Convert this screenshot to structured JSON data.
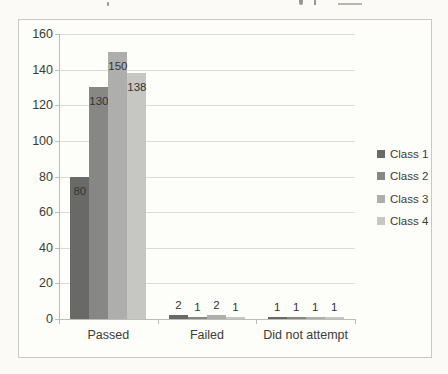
{
  "chart_data": {
    "type": "bar",
    "title": "",
    "categories": [
      "Passed",
      "Failed",
      "Did not attempt"
    ],
    "series": [
      {
        "name": "Class 1",
        "color": "#696967",
        "values": [
          80,
          2,
          1
        ]
      },
      {
        "name": "Class 2",
        "color": "#878785",
        "values": [
          130,
          1,
          1
        ]
      },
      {
        "name": "Class 3",
        "color": "#aeaeac",
        "values": [
          150,
          2,
          1
        ]
      },
      {
        "name": "Class 4",
        "color": "#c6c6c3",
        "values": [
          138,
          1,
          1
        ]
      }
    ],
    "yticks": [
      0,
      20,
      40,
      60,
      80,
      100,
      120,
      140,
      160
    ],
    "ylim": [
      0,
      160
    ],
    "ytick_step": 20,
    "grid": true,
    "legend_position": "right",
    "data_labels": true
  },
  "colors": {
    "paper": "#fbfaf6",
    "chart_background": "#fdfdf9",
    "frame_border": "#c9c9c2",
    "gridline": "#dcdcd6",
    "axis": "#bdbdb6",
    "text": "#3c3c3a"
  }
}
